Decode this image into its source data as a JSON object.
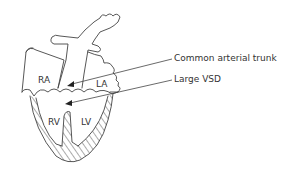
{
  "diagram": {
    "chambers": [
      {
        "id": "ra",
        "label": "RA"
      },
      {
        "id": "la",
        "label": "LA"
      },
      {
        "id": "rv",
        "label": "RV"
      },
      {
        "id": "lv",
        "label": "LV"
      }
    ],
    "callouts": [
      {
        "id": "common-arterial-trunk",
        "label": "Common arterial trunk"
      },
      {
        "id": "large-vsd",
        "label": "Large VSD"
      }
    ],
    "colors": {
      "line": "#444444",
      "text": "#333333",
      "background": "#ffffff"
    }
  }
}
